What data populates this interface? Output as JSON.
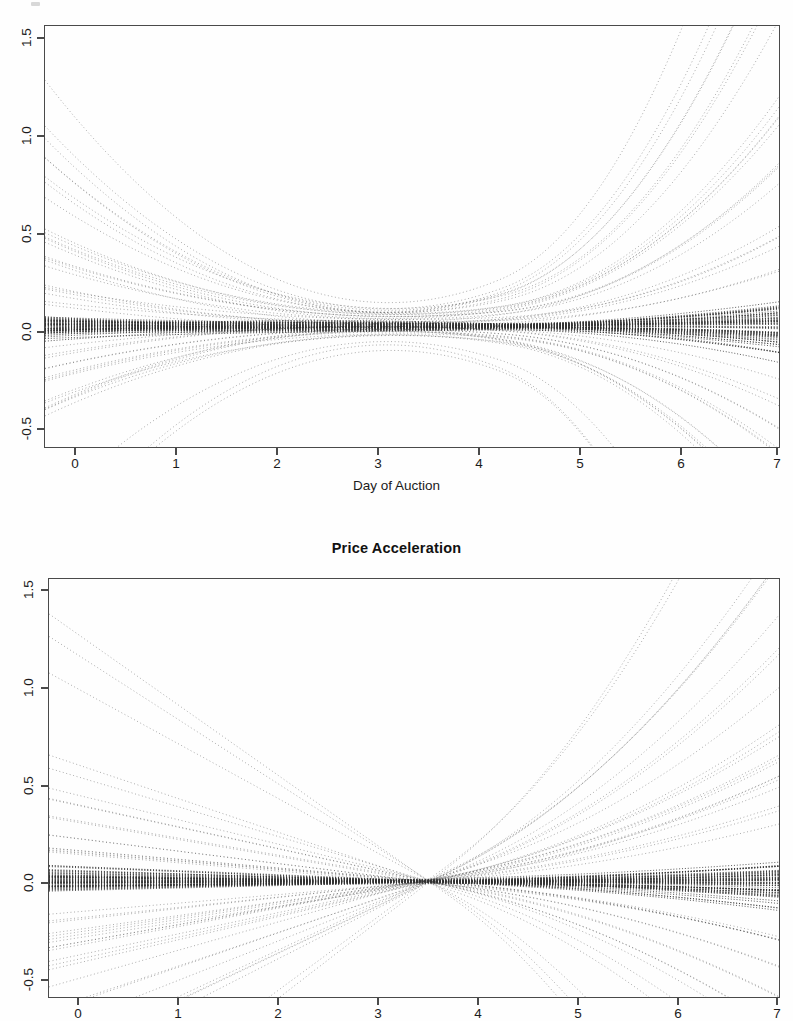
{
  "figure": {
    "background_color": "#fefefe",
    "ink_color": "#333333",
    "axis_color": "#4a4a4a",
    "panel_count": 2
  },
  "panels": [
    {
      "name": "price-velocity",
      "title": "",
      "title_visible": false,
      "xlabel": "Day of Auction",
      "ylabel": "",
      "xticks": [
        "0",
        "1",
        "2",
        "3",
        "4",
        "5",
        "6",
        "7"
      ],
      "yticks": [
        "-0.5",
        "0.0",
        "0.5",
        "1.0",
        "1.5"
      ]
    },
    {
      "name": "price-acceleration",
      "title": "Price Acceleration",
      "title_visible": true,
      "xlabel": "",
      "ylabel": "",
      "xticks": [
        "0",
        "1",
        "2",
        "3",
        "4",
        "5",
        "6",
        "7"
      ],
      "yticks": [
        "-0.5",
        "0.0",
        "0.5",
        "1.0",
        "1.5"
      ]
    }
  ],
  "chart_data": [
    {
      "type": "line",
      "name": "price-velocity",
      "title": "",
      "xlabel": "Day of Auction",
      "ylabel": "",
      "xlim": [
        0,
        7
      ],
      "ylim": [
        -0.6,
        1.55
      ],
      "xticks": [
        0,
        1,
        2,
        3,
        4,
        5,
        6,
        7
      ],
      "yticks": [
        -0.5,
        0.0,
        0.5,
        1.0,
        1.5
      ],
      "grid": false,
      "legend": "none",
      "line_style": "dotted",
      "n_series": 104,
      "description": "Smoothed price velocity curves for individual online auctions; U-shaped envelope with a dense band near zero, high early values decaying by day 2 and a steep rise after day 5.",
      "x": [
        0,
        0.5,
        1,
        1.5,
        2,
        2.5,
        3,
        3.5,
        4,
        4.5,
        5,
        5.5,
        6,
        6.5,
        7
      ],
      "series": [
        {
          "name": "envelope-upper",
          "values": [
            1.55,
            1.3,
            1.05,
            0.8,
            0.62,
            0.52,
            0.47,
            0.46,
            0.48,
            0.55,
            0.7,
            0.92,
            1.15,
            1.38,
            1.55
          ]
        },
        {
          "name": "envelope-lower",
          "values": [
            -0.6,
            -0.42,
            -0.28,
            -0.2,
            -0.16,
            -0.15,
            -0.16,
            -0.18,
            -0.2,
            -0.2,
            -0.19,
            -0.18,
            -0.19,
            -0.24,
            -0.38
          ]
        },
        {
          "name": "median-band",
          "values": [
            0.02,
            0.02,
            0.02,
            0.02,
            0.02,
            0.02,
            0.02,
            0.02,
            0.02,
            0.03,
            0.03,
            0.04,
            0.05,
            0.07,
            0.09
          ]
        },
        {
          "name": "upper-quartile",
          "values": [
            0.45,
            0.38,
            0.31,
            0.26,
            0.22,
            0.2,
            0.19,
            0.19,
            0.2,
            0.23,
            0.29,
            0.38,
            0.5,
            0.64,
            0.78
          ]
        },
        {
          "name": "lower-quartile",
          "values": [
            -0.15,
            -0.11,
            -0.08,
            -0.07,
            -0.06,
            -0.06,
            -0.06,
            -0.07,
            -0.07,
            -0.07,
            -0.06,
            -0.05,
            -0.05,
            -0.06,
            -0.08
          ]
        }
      ]
    },
    {
      "type": "line",
      "name": "price-acceleration",
      "title": "Price Acceleration",
      "xlabel": "",
      "ylabel": "",
      "xlim": [
        0,
        7
      ],
      "ylim": [
        -0.6,
        1.55
      ],
      "xticks": [
        0,
        1,
        2,
        3,
        4,
        5,
        6,
        7
      ],
      "yticks": [
        -0.5,
        0.0,
        0.5,
        1.0,
        1.5
      ],
      "grid": false,
      "legend": "none",
      "line_style": "dotted",
      "n_series": 104,
      "description": "Smoothed price acceleration curves; near-linear fan pinching to a narrow waist around day 3.5-4 then diverging strongly toward day 7.",
      "x": [
        0,
        0.5,
        1,
        1.5,
        2,
        2.5,
        3,
        3.5,
        4,
        4.5,
        5,
        5.5,
        6,
        6.5,
        7
      ],
      "series": [
        {
          "name": "envelope-upper",
          "values": [
            1.02,
            0.88,
            0.74,
            0.6,
            0.46,
            0.33,
            0.21,
            0.12,
            0.15,
            0.32,
            0.55,
            0.82,
            1.08,
            1.32,
            1.52
          ]
        },
        {
          "name": "envelope-lower",
          "values": [
            -0.6,
            -0.52,
            -0.44,
            -0.36,
            -0.28,
            -0.21,
            -0.14,
            -0.08,
            -0.06,
            -0.08,
            -0.12,
            -0.17,
            -0.24,
            -0.33,
            -0.46
          ]
        },
        {
          "name": "median-band",
          "values": [
            0.0,
            0.0,
            0.0,
            -0.01,
            -0.01,
            -0.01,
            -0.01,
            0.0,
            0.01,
            0.02,
            0.04,
            0.06,
            0.08,
            0.11,
            0.14
          ]
        },
        {
          "name": "upper-quartile",
          "values": [
            0.4,
            0.35,
            0.29,
            0.23,
            0.18,
            0.13,
            0.08,
            0.05,
            0.07,
            0.13,
            0.2,
            0.27,
            0.33,
            0.38,
            0.42
          ]
        },
        {
          "name": "lower-quartile",
          "values": [
            -0.3,
            -0.26,
            -0.22,
            -0.18,
            -0.14,
            -0.1,
            -0.07,
            -0.04,
            -0.03,
            -0.04,
            -0.05,
            -0.07,
            -0.09,
            -0.12,
            -0.16
          ]
        }
      ]
    }
  ]
}
